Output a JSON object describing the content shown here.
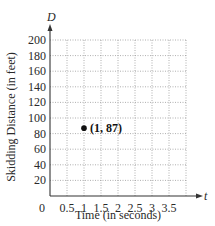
{
  "chart_data": {
    "type": "scatter",
    "title": "",
    "xlabel": "Time (in seconds)",
    "ylabel": "Skidding Distance (in feet)",
    "x_axis_variable": "t",
    "y_axis_variable": "D",
    "x_ticks": [
      "0",
      "0.5",
      "1",
      "1.5",
      "2",
      "2.5",
      "3",
      "3.5"
    ],
    "y_ticks": [
      "20",
      "40",
      "60",
      "80",
      "100",
      "120",
      "140",
      "160",
      "180",
      "200"
    ],
    "xlim": [
      0,
      4
    ],
    "ylim": [
      0,
      200
    ],
    "grid": true,
    "grid_style": "dotted",
    "series": [
      {
        "name": "point",
        "points": [
          {
            "x": 1,
            "y": 87,
            "label": "(1, 87)"
          }
        ]
      }
    ],
    "legend": null
  },
  "colors": {
    "axis": "#333333",
    "grid": "#9a9a9a",
    "point": "#111111",
    "text": "#2a2a2a"
  }
}
